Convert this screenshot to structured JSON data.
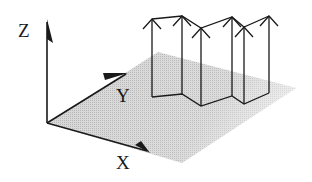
{
  "diagram": {
    "axes": {
      "x": {
        "label": "X"
      },
      "y": {
        "label": "Y"
      },
      "z": {
        "label": "Z"
      }
    },
    "colors": {
      "line": "#1a1a1a",
      "plane": "#c8c8c8",
      "background": "#ffffff"
    },
    "panels": {
      "count": 5,
      "arrow_count": 6
    }
  }
}
